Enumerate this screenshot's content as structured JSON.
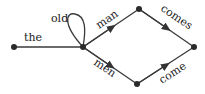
{
  "diagram": {
    "type": "word-lattice",
    "nodes": [
      {
        "id": "start",
        "x": 14,
        "y": 47
      },
      {
        "id": "hub",
        "x": 83,
        "y": 47
      },
      {
        "id": "top",
        "x": 139,
        "y": 9
      },
      {
        "id": "bottom",
        "x": 137,
        "y": 84
      },
      {
        "id": "end",
        "x": 194,
        "y": 47
      }
    ],
    "edges": [
      {
        "from": "start",
        "to": "hub",
        "label": "the"
      },
      {
        "from": "hub",
        "to": "hub",
        "label": "old"
      },
      {
        "from": "hub",
        "to": "top",
        "label": "man"
      },
      {
        "from": "hub",
        "to": "bottom",
        "label": "men"
      },
      {
        "from": "top",
        "to": "end",
        "label": "comes"
      },
      {
        "from": "bottom",
        "to": "end",
        "label": "come"
      }
    ]
  }
}
